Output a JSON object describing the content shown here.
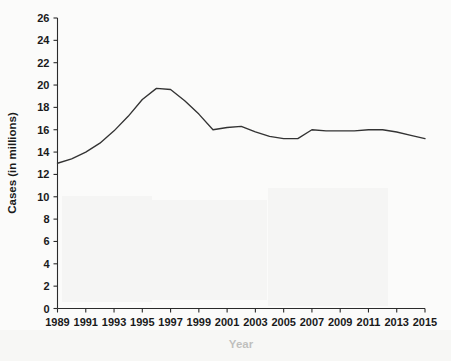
{
  "chart_data": {
    "type": "line",
    "title": "",
    "xlabel": "Year",
    "ylabel": "Cases (in millions)",
    "xlim": [
      1989,
      2015
    ],
    "ylim": [
      0,
      26
    ],
    "grid": false,
    "legend": "none",
    "x_tick_labels": [
      "1989",
      "1991",
      "1993",
      "1995",
      "1997",
      "1999",
      "2001",
      "2003",
      "2005",
      "2007",
      "2009",
      "2011",
      "2013",
      "2015"
    ],
    "y_tick_labels": [
      "0",
      "2",
      "4",
      "6",
      "8",
      "10",
      "12",
      "14",
      "16",
      "18",
      "20",
      "22",
      "24",
      "26"
    ],
    "y_tick_values": [
      0,
      2,
      4,
      6,
      8,
      10,
      12,
      14,
      16,
      18,
      20,
      22,
      24,
      26
    ],
    "x_tick_values": [
      1989,
      1991,
      1993,
      1995,
      1997,
      1999,
      2001,
      2003,
      2005,
      2007,
      2009,
      2011,
      2013,
      2015
    ],
    "x": [
      1989,
      1990,
      1991,
      1992,
      1993,
      1994,
      1995,
      1996,
      1997,
      1998,
      1999,
      2000,
      2001,
      2002,
      2003,
      2004,
      2005,
      2006,
      2007,
      2008,
      2009,
      2010,
      2011,
      2012,
      2013,
      2014,
      2015
    ],
    "values": [
      13.0,
      13.4,
      14.0,
      14.8,
      15.9,
      17.2,
      18.7,
      19.7,
      19.6,
      18.6,
      17.4,
      16.0,
      16.2,
      16.3,
      15.8,
      15.4,
      15.2,
      15.2,
      16.0,
      15.9,
      15.9,
      15.9,
      16.0,
      16.0,
      15.8,
      15.5,
      15.2
    ],
    "series": [
      {
        "name": "Cases",
        "color": "#333333",
        "values": [
          13.0,
          13.4,
          14.0,
          14.8,
          15.9,
          17.2,
          18.7,
          19.7,
          19.6,
          18.6,
          17.4,
          16.0,
          16.2,
          16.3,
          15.8,
          15.4,
          15.2,
          15.2,
          16.0,
          15.9,
          15.9,
          15.9,
          16.0,
          16.0,
          15.8,
          15.5,
          15.2
        ]
      }
    ]
  }
}
